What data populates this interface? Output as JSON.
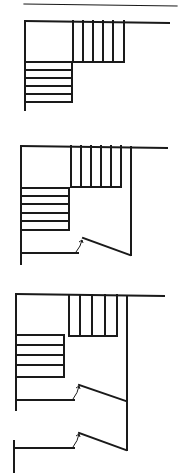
{
  "page": {
    "kind": "line-drawing page of stair floor plans",
    "background": "#ffffff",
    "ink": "#1a1a1a"
  },
  "header_rule": {
    "x1": 24,
    "y1": 4,
    "x2": 177,
    "y2": 6
  },
  "diagrams": [
    {
      "id": "plan-1",
      "label": "L-shaped stair, open",
      "outer_top": {
        "x1": 25,
        "y1": 21,
        "x2": 169,
        "y2": 23
      },
      "left_wall": {
        "x": 25,
        "y1": 21,
        "y2": 110
      },
      "upper_flight": {
        "x_treads": [
          73,
          83,
          93,
          103,
          113,
          124
        ],
        "y_top": 21,
        "y_bottom": 62
      },
      "lower_flight": {
        "x_left": 25,
        "x_right": 72,
        "y_treads": [
          62,
          70,
          78,
          86,
          94,
          102
        ]
      },
      "right_wall": null,
      "doors": []
    },
    {
      "id": "plan-2",
      "label": "L-shaped stair with door",
      "outer_top": {
        "x1": 21,
        "y1": 146,
        "x2": 167,
        "y2": 148
      },
      "left_wall": {
        "x": 21,
        "y1": 146,
        "y2": 264
      },
      "upper_flight": {
        "x_treads": [
          71,
          81,
          91,
          101,
          111,
          121
        ],
        "y_top": 146,
        "y_bottom": 187
      },
      "lower_flight": {
        "x_left": 21,
        "x_right": 69,
        "y_treads": [
          188,
          196,
          204,
          213,
          221,
          230
        ]
      },
      "right_wall": {
        "x": 131,
        "y1": 147,
        "y2": 255
      },
      "doors": [
        {
          "wall_y": 253,
          "wall_x1": 21,
          "wall_x2": 78,
          "leaf": {
            "x1": 83,
            "y1": 238,
            "x2": 130,
            "y2": 255
          },
          "swing": {
            "x1": 76,
            "y1": 252,
            "x2": 82,
            "y2": 240
          }
        }
      ]
    },
    {
      "id": "plan-3",
      "label": "L-shaped stair with two doors",
      "outer_top": {
        "x1": 16,
        "y1": 294,
        "x2": 164,
        "y2": 296
      },
      "left_wall": {
        "x": 16,
        "y1": 294,
        "y2": 410
      },
      "upper_flight": {
        "x_treads": [
          69,
          80,
          92,
          105,
          117
        ],
        "y_top": 295,
        "y_bottom": 336
      },
      "lower_flight": {
        "x_left": 16,
        "x_right": 64,
        "y_treads": [
          335,
          345,
          355,
          365,
          377
        ]
      },
      "right_wall": {
        "x": 127,
        "y1": 296,
        "y2": 450
      },
      "lower_left_wall": {
        "x": 14,
        "y1": 441,
        "y2": 473
      },
      "doors": [
        {
          "wall_y": 400,
          "wall_x1": 16,
          "wall_x2": 74,
          "leaf": {
            "x1": 79,
            "y1": 385,
            "x2": 126,
            "y2": 401
          },
          "swing": {
            "x1": 73,
            "y1": 399,
            "x2": 79,
            "y2": 386
          }
        },
        {
          "wall_y": 448,
          "wall_x1": 16,
          "wall_x2": 74,
          "leaf": {
            "x1": 79,
            "y1": 433,
            "x2": 126,
            "y2": 450
          },
          "swing": {
            "x1": 73,
            "y1": 447,
            "x2": 79,
            "y2": 434
          }
        }
      ]
    }
  ]
}
